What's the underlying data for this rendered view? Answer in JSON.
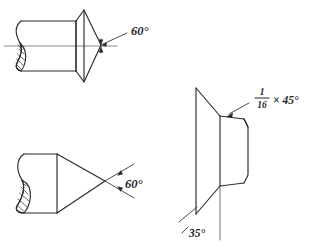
{
  "page": {
    "background_color": "#ffffff",
    "line_color": "#2b2b2b",
    "text_color": "#262626",
    "width": 321,
    "height": 250
  },
  "views": {
    "top_left": {
      "name": "Countersunk conical end with broken-out section",
      "annotation": {
        "label": "60°",
        "value": 60,
        "unit": "degrees",
        "kind": "included-angle",
        "leader_from": [
          130,
          32
        ],
        "leader_to": [
          101,
          45
        ],
        "arrow_at": [
          101,
          45
        ]
      },
      "centerline": {
        "from": [
          4,
          46
        ],
        "to": [
          117,
          46
        ]
      },
      "features": [
        "broken-out-section",
        "hatching",
        "conical-chamfer",
        "cylinder"
      ]
    },
    "bottom_left": {
      "name": "Conical point on cylindrical stock with broken-out section",
      "annotation": {
        "label": "60°",
        "value": 60,
        "unit": "degrees",
        "kind": "point-angle",
        "vertex": [
          105,
          181
        ],
        "arrow_upper_at": [
          121,
          170
        ],
        "arrow_lower_at": [
          121,
          192
        ]
      },
      "features": [
        "broken-out-section",
        "hatching",
        "cone-point",
        "cylinder"
      ]
    },
    "right": {
      "name": "Flared flange with cylindrical boss, chamfer detail",
      "annotations": [
        {
          "label_numerator": "1",
          "label_denominator": "16",
          "label_multiplier": "× 45°",
          "full_label": "1/16 × 45°",
          "value_size": 0.0625,
          "value_angle": 45,
          "unit": "inch × degrees",
          "kind": "chamfer-callout",
          "leader_from": [
            248,
            103
          ],
          "leader_to": [
            227,
            116
          ],
          "arrow_at": [
            227,
            116
          ]
        },
        {
          "label": "35°",
          "value": 35,
          "unit": "degrees",
          "kind": "flare-angle",
          "leader_from": [
            180,
            219
          ],
          "leader_to": [
            196,
            206
          ],
          "text_at": [
            187,
            235
          ]
        }
      ],
      "features": [
        "flared-flange",
        "cylindrical-boss",
        "chamfer",
        "vertical-reference-line"
      ]
    }
  }
}
